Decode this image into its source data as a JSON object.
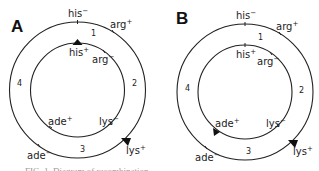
{
  "panels": [
    {
      "id": "A",
      "label": "A",
      "markers": {
        "his_minus": {
          "gene": "his",
          "sign": "−"
        },
        "arg_plus": {
          "gene": "arg",
          "sign": "+"
        },
        "his_plus": {
          "gene": "his",
          "sign": "+"
        },
        "arg_minus": {
          "gene": "arg",
          "sign": "−"
        },
        "ade_plus": {
          "gene": "ade",
          "sign": "+"
        },
        "lys_minus": {
          "gene": "lys",
          "sign": "−"
        },
        "ade_minus": {
          "gene": "ade",
          "sign": "−"
        },
        "lys_plus": {
          "gene": "lys",
          "sign": "+"
        }
      },
      "segments": [
        "1",
        "2",
        "3",
        "4"
      ],
      "arrowheads": [
        "his+ (inner, top)",
        "lys+ (outer, lower right)"
      ]
    },
    {
      "id": "B",
      "label": "B",
      "markers": {
        "his_minus": {
          "gene": "his",
          "sign": "−"
        },
        "arg_plus": {
          "gene": "arg",
          "sign": "+"
        },
        "his_plus": {
          "gene": "his",
          "sign": "+"
        },
        "arg_minus": {
          "gene": "arg",
          "sign": "−"
        },
        "ade_plus": {
          "gene": "ade",
          "sign": "+"
        },
        "lys_minus": {
          "gene": "lys",
          "sign": "−"
        },
        "ade_minus": {
          "gene": "ade",
          "sign": "−"
        },
        "lys_plus": {
          "gene": "lys",
          "sign": "+"
        }
      },
      "segments": [
        "1",
        "2",
        "3",
        "4"
      ],
      "arrowheads": [
        "ade+ (inner, lower left)",
        "lys+ (outer, lower right)"
      ]
    }
  ],
  "caption": "FIG. 1. Diagram of recombination ..."
}
